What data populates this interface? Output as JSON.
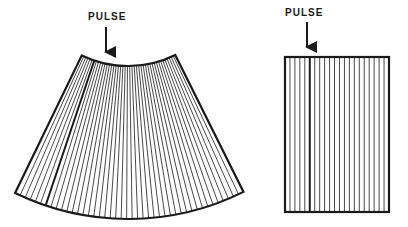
{
  "diagrams": {
    "sector": {
      "label": "PULSE",
      "line_count": 44,
      "highlighted_line_index": 6
    },
    "linear": {
      "label": "PULSE",
      "line_count": 20,
      "highlighted_line_index": 4
    }
  },
  "colors": {
    "ink": "#1a1a1a",
    "background": "#ffffff"
  }
}
